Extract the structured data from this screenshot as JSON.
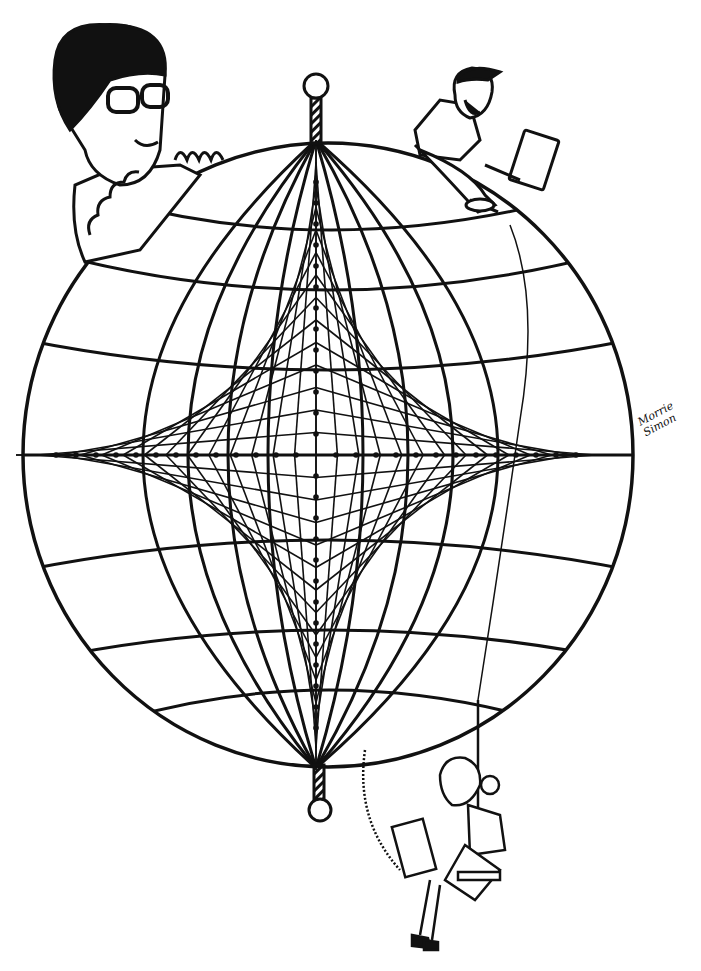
{
  "illustration": {
    "subject": "globe with string-art astroid star and three cartoon figures",
    "colors": {
      "ink": "#111111",
      "paper": "#ffffff"
    },
    "globe": {
      "cx": 328,
      "cy": 455,
      "rx": 305,
      "ry": 312
    },
    "poles": {
      "top": {
        "cx": 316,
        "cy": 86,
        "r": 12
      },
      "bottom": {
        "cx": 320,
        "cy": 810,
        "r": 11
      }
    },
    "figures": [
      {
        "name": "man-with-glasses",
        "position": "top-left"
      },
      {
        "name": "man-with-cap-and-laptop",
        "position": "top-right"
      },
      {
        "name": "woman-on-swing-with-laptop",
        "position": "bottom"
      }
    ],
    "signature": {
      "line1": "Morrie",
      "line2": "Simon"
    }
  }
}
